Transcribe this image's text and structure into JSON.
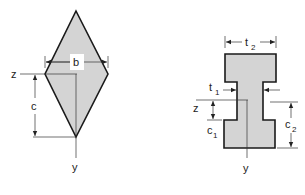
{
  "figure": {
    "left": {
      "shape": "rhombus",
      "labels": {
        "width": "b",
        "height": "c",
        "z_axis": "z",
        "y_axis": "y"
      },
      "fill_color": "#d4d4d4",
      "stroke_color": "#1a1a1a"
    },
    "right": {
      "shape": "i-section",
      "labels": {
        "flange_width": "t",
        "flange_width_sub": "2",
        "web_thickness": "t",
        "web_thickness_sub": "1",
        "c_lower": "c",
        "c_lower_sub": "1",
        "c_upper": "c",
        "c_upper_sub": "2",
        "z_axis": "z",
        "y_axis": "y"
      },
      "fill_color": "#d4d4d4",
      "stroke_color": "#1a1a1a"
    }
  }
}
